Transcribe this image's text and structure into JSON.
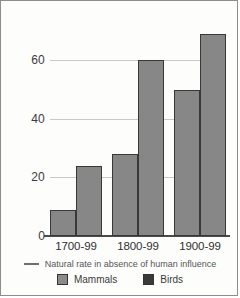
{
  "chart_data": {
    "type": "bar",
    "title": "",
    "xlabel": "",
    "ylabel": "",
    "categories": [
      "1700-99",
      "1800-99",
      "1900-99"
    ],
    "series": [
      {
        "name": "Mammals",
        "values": [
          9,
          28,
          50
        ],
        "color": "#878787"
      },
      {
        "name": "Birds",
        "values": [
          24,
          60,
          69
        ],
        "color": "#878787"
      }
    ],
    "yticks": [
      0,
      20,
      40,
      60
    ],
    "ylim": [
      0,
      72
    ],
    "grid": true,
    "legend_position": "bottom",
    "annotations": [
      "Natural rate in absence of human influence"
    ]
  },
  "axis": {
    "ytick_0": "0",
    "ytick_20": "20",
    "ytick_40": "40",
    "ytick_60": "60"
  },
  "xaxis": {
    "label_0": "1700-99",
    "label_1": "1800-99",
    "label_2": "1900-99"
  },
  "legend": {
    "natural_rate": "Natural rate in absence of human influence",
    "mammals": "Mammals",
    "birds": "Birds"
  }
}
